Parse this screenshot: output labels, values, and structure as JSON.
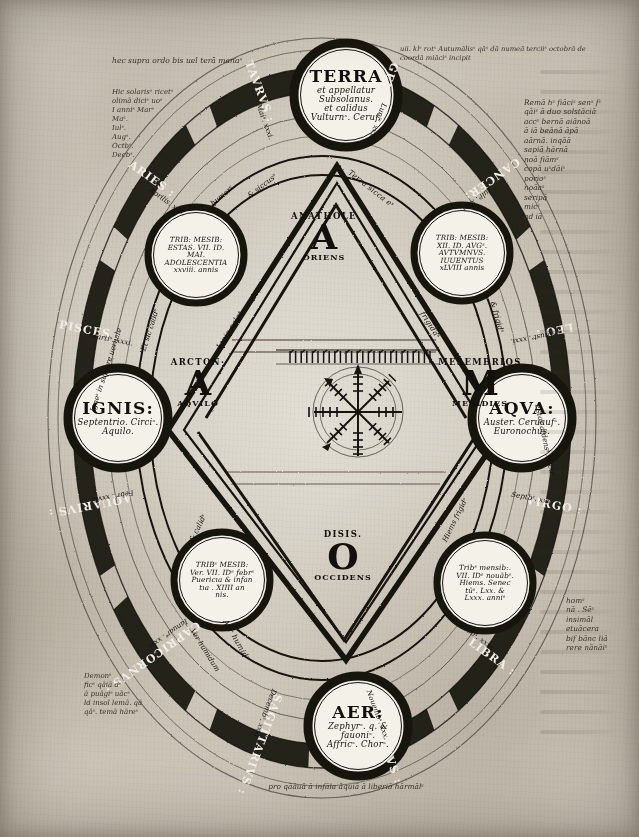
{
  "page": {
    "width": 639,
    "height": 837,
    "ink_color": "#120f0d",
    "parchment_color": "#cfcac0"
  },
  "elements": [
    {
      "key": "terra",
      "name": "TERRA",
      "sub1": "et appellatur",
      "sub2": "Subsolanus.",
      "sub3": "et calidus",
      "sub4": "Vulturnˢ. Ceruf.",
      "position": "top",
      "cx": 346,
      "cy": 95,
      "r": 52
    },
    {
      "key": "ignis",
      "name": "IGNIS:",
      "sub1": "Septentrio. Circiˢ.",
      "sub2": "Aquilo.",
      "position": "left",
      "cx": 118,
      "cy": 418,
      "r": 50
    },
    {
      "key": "aqua",
      "name": "AQVA:",
      "sub1": "Auster. Ceruaufˢ.",
      "sub2": "Euronochus.",
      "position": "right",
      "cx": 522,
      "cy": 418,
      "r": 50
    },
    {
      "key": "aer",
      "name": "AER:",
      "sub1": "Zephyrˢ. q. & fauoniˢ.",
      "sub2": "Affricˢ. Chorˢ.",
      "position": "bottom",
      "cx": 358,
      "cy": 726,
      "r": 50
    }
  ],
  "seasons": [
    {
      "key": "aestas",
      "lines": [
        "TRIB: MESIB:",
        "ESTAS. VII. ID.",
        "MAI.",
        "ADOLESCENTIA",
        "xxviii. annis"
      ],
      "cx": 196,
      "cy": 255,
      "r": 48
    },
    {
      "key": "autumnus",
      "lines": [
        "TRIB: MESIB:",
        "XII. ID. AVGˢ.",
        "AVTVMNVS.",
        "IUUENTUS",
        "xLVIII annis"
      ],
      "cx": 462,
      "cy": 253,
      "r": 48
    },
    {
      "key": "ver",
      "lines": [
        "TRIBˢ MESIB:",
        "Ver. VII. IDˢ febrˢ",
        "Puericıa & infan",
        "tıa . XIIII an",
        "nis."
      ],
      "cx": 222,
      "cy": 580,
      "r": 48
    },
    {
      "key": "hiems",
      "lines": [
        "Tribˢ mensib:.",
        "VII. IDˢ nouābˢ.",
        "Hiems. Senec",
        "tūˢ. Lxx. &",
        "Lxxx. anniˢ"
      ],
      "cx": 485,
      "cy": 583,
      "r": 48
    }
  ],
  "directions": [
    {
      "key": "anatole",
      "greek": "ANATHOLE",
      "letter": "A",
      "latin": "ORIENS",
      "x": 324,
      "y": 237
    },
    {
      "key": "arcton",
      "greek": "ARCTON·",
      "letter": "A",
      "latin": "AQVILO",
      "x": 198,
      "y": 383
    },
    {
      "key": "mesembrios",
      "greek": "MESEMBRIOS",
      "letter": "M",
      "latin": "MERIDIES",
      "x": 480,
      "y": 383
    },
    {
      "key": "disis",
      "greek": "DISIS.",
      "letter": "O",
      "latin": "OCCIDENS",
      "x": 343,
      "y": 556
    }
  ],
  "zodiac": [
    {
      "key": "gemini",
      "label": "GEMINI·",
      "sub": "Luniˢ. xxx."
    },
    {
      "key": "cancer",
      "label": "CANCER:",
      "sub": "Iuliˢ. xxxi."
    },
    {
      "key": "leo",
      "label": "LEO :",
      "sub": "Agustˢ. xxxi."
    },
    {
      "key": "virgo",
      "label": "VIRGO :",
      "sub": "Septbˢ. xxx."
    },
    {
      "key": "libra",
      "label": "LIBRA :",
      "sub": "Octobˢ. xxxi."
    },
    {
      "key": "scorpius",
      "label": "SCORPIVS :",
      "sub": "Nouembˢ. xxx."
    },
    {
      "key": "sagittarius",
      "label": "SAGITTARIVS :",
      "sub": "Decembˢ. xxxi."
    },
    {
      "key": "capricornus",
      "label": "CAPRICORNVS :",
      "sub": "Ianuarˢ. xxxi."
    },
    {
      "key": "aquarius",
      "label": "AQUARIVS :",
      "sub": "Febrˢ. xxviii."
    },
    {
      "key": "pisces",
      "label": "PISCES :",
      "sub": "Martiˢ. xxxi."
    },
    {
      "key": "aries",
      "label": "ARIES :",
      "sub": "Aprilis. xxx."
    },
    {
      "key": "taurus",
      "label": "TAVRVS :",
      "sub": "Maiˢ. xxxi."
    }
  ],
  "qualities": [
    {
      "key": "q-humidus-ne",
      "text": "& siccusˢ"
    },
    {
      "key": "q-calidus-se",
      "text": "& frigidˢ"
    },
    {
      "key": "q-calidus-sw",
      "text": "& calidˢ"
    },
    {
      "key": "q-humidus-nw",
      "text": "Et sic calidˢ"
    },
    {
      "key": "q-humor-top",
      "text": "humorˢ"
    }
  ],
  "inner_labels": [
    {
      "key": "terra-sicca",
      "text": "Terra sicca eˢ"
    },
    {
      "key": "ignis-calet",
      "text": "Ignis calet"
    },
    {
      "key": "aqua-frigida",
      "text": "frigidaˢ"
    },
    {
      "key": "aer-humid",
      "text": "Aer humidˢ"
    }
  ],
  "ribbon_notes": [
    {
      "key": "rib-nw",
      "text": "Igneˢ in supiore uernale"
    },
    {
      "key": "rib-sw",
      "text": "Ver humidum"
    },
    {
      "key": "rib-se",
      "text": "Hiems frigidˢ"
    },
    {
      "key": "rib-ne",
      "text": "Estas ardensˢ siccuˢ"
    }
  ],
  "marginalia": {
    "top_left": "hec supra ordo bis uel terā manaˢ",
    "top_right": "uii. klˢ rotˢ Autumālisˢ qāˢ dā numeā terciiˢ octobrā de coordā miāciˢ incipit",
    "left_block": [
      "Hic solarisˢ ricetˢ",
      "olimā diciˢ uoˢ",
      "I anniˢ Marˢ",
      "Maˢ.",
      "Iulˢ.",
      "Augˢ.",
      "Octbˢ.",
      "Decbˢ."
    ],
    "right_block": [
      "Remā hˢ fiāciˢ senˢ fˢ",
      "qāiˢ ā duo solstāciā",
      "accˢ bernā aiānoā",
      "ā iā beānā āpā",
      "aārnā. inqāā",
      "sapiā hārnā",
      "noā fiāmˢ",
      "copā uˢdāiˢ",
      "porioˢ",
      "noāaˢ",
      "seripā",
      "micˢ",
      "ad iā"
    ],
    "bottom_right": [
      "homˢ",
      "nā . Sēˢ",
      "insimāl",
      "etuācera",
      "bif bānc liā",
      "rere nānāiˢ"
    ],
    "bottom_left": [
      "Demonˢ",
      "ficˢ qāiā dˢ",
      "ā puāgiˢ uācˢ",
      "ld insol lemā. qā",
      "qāˢ. temā hāreˢ"
    ],
    "bottom_band": "pro qāāuā ā infāla āquiā ā liberiā hārmālˢ"
  },
  "rota": {
    "key": "wind-rose",
    "description": "runic tally wheel with eight spokes",
    "cx": 358,
    "cy": 412,
    "r": 44,
    "spokes": 8
  }
}
